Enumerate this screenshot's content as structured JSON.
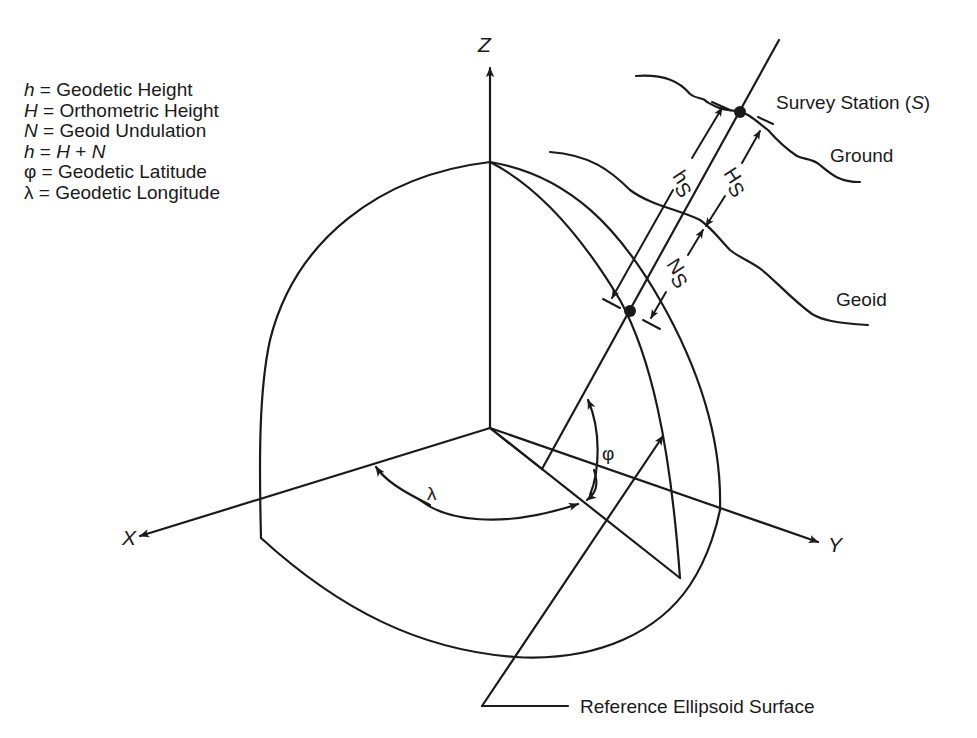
{
  "legend": {
    "items": [
      {
        "symbol": "h",
        "text": " = Geodetic Height"
      },
      {
        "symbol": "H",
        "text": " = Orthometric Height"
      },
      {
        "symbol": "N",
        "text": " = Geoid Undulation"
      },
      {
        "symbol": "h",
        "text": " = ",
        "symbol2": "H",
        "mid": " + ",
        "symbol3": "N"
      },
      {
        "symbol": "φ",
        "text": " = Geodetic Latitude"
      },
      {
        "symbol": "λ",
        "text": " = Geodetic Longitude"
      }
    ]
  },
  "axes": {
    "x_label": "X",
    "y_label": "Y",
    "z_label": "Z"
  },
  "angles": {
    "longitude": "λ",
    "latitude": "φ"
  },
  "labels": {
    "survey_station": "Survey Station (",
    "survey_station_symbol": "S",
    "survey_station_close": ")",
    "ground": "Ground",
    "geoid": "Geoid",
    "reference_surface": "Reference Ellipsoid Surface"
  },
  "measurements": {
    "geodetic_height": {
      "symbol": "h",
      "sub": "S"
    },
    "orthometric_height": {
      "symbol": "H",
      "sub": "S"
    },
    "geoid_undulation": {
      "symbol": "N",
      "sub": "S"
    }
  },
  "colors": {
    "ink": "#1a1a1a",
    "background": "#ffffff"
  }
}
